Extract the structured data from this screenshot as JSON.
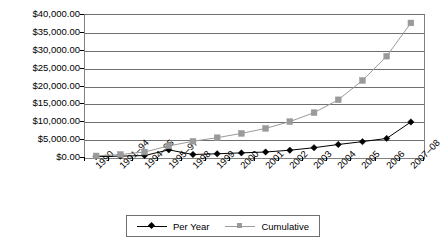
{
  "chart_data": {
    "type": "line",
    "title": "",
    "xlabel": "",
    "ylabel": "",
    "ylim": [
      0,
      40000
    ],
    "ytick_values": [
      0,
      5000,
      10000,
      15000,
      20000,
      25000,
      30000,
      35000,
      40000
    ],
    "ytick_labels": [
      "$0.00",
      "$5,000.00",
      "$10,000.00",
      "$15,000.00",
      "$20,000.00",
      "$25,000.00",
      "$30,000.00",
      "$35,000.00",
      "$40,000.00"
    ],
    "categories": [
      "1990",
      "1991–94",
      "1994–95",
      "1995–97",
      "1998",
      "1999",
      "2000",
      "2001",
      "2002",
      "2003",
      "2004",
      "2005",
      "2006",
      "2007–08"
    ],
    "grid": true,
    "legend_position": "bottom",
    "series": [
      {
        "name": "Per Year",
        "color": "#000000",
        "marker": "diamond",
        "values": [
          100,
          250,
          400,
          2000,
          700,
          900,
          1150,
          1400,
          1900,
          2600,
          3500,
          4300,
          5200,
          9800
        ]
      },
      {
        "name": "Cumulative",
        "color": "#9a9a9a",
        "marker": "square",
        "values": [
          300,
          700,
          1400,
          3100,
          4400,
          5400,
          6600,
          8000,
          9900,
          12400,
          16000,
          21400,
          28200,
          37500
        ]
      }
    ]
  },
  "legend": {
    "entries": [
      {
        "label": "Per Year",
        "marker": "diamond-marker",
        "color": "#000000"
      },
      {
        "label": "Cumulative",
        "marker": "square-marker",
        "color": "#9a9a9a"
      }
    ]
  }
}
